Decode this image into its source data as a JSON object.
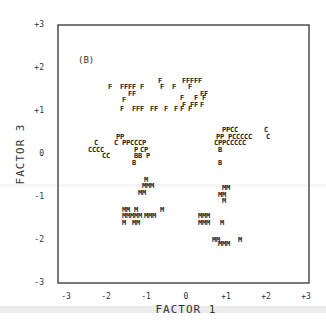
{
  "chart_data": {
    "type": "scatter",
    "title": "",
    "panel_label": "(B)",
    "xlabel": "FACTOR 1",
    "ylabel": "FACTOR 3",
    "xlim": [
      -3,
      3
    ],
    "ylim": [
      -3,
      3
    ],
    "grid": false,
    "legend": "none (points plotted as letter symbols F, P, C, B, M)",
    "x_ticks": [
      "-3",
      "-2",
      "-1",
      "0",
      "+1",
      "+2",
      "+3"
    ],
    "y_ticks": [
      "+3",
      "+2",
      "+1",
      "0",
      "-1",
      "-2",
      "-3"
    ],
    "series": [
      {
        "name": "F",
        "points": [
          [
            -1.9,
            1.55
          ],
          [
            -1.6,
            1.55
          ],
          [
            -1.5,
            1.55
          ],
          [
            -1.4,
            1.55
          ],
          [
            -1.3,
            1.55
          ],
          [
            -1.1,
            1.55
          ],
          [
            -0.65,
            1.7
          ],
          [
            -0.6,
            1.55
          ],
          [
            -0.3,
            1.55
          ],
          [
            -1.4,
            1.4
          ],
          [
            -1.3,
            1.4
          ],
          [
            -1.55,
            1.25
          ],
          [
            -1.6,
            1.05
          ],
          [
            -1.3,
            1.05
          ],
          [
            -1.2,
            1.05
          ],
          [
            -1.1,
            1.05
          ],
          [
            -0.85,
            1.05
          ],
          [
            -0.75,
            1.05
          ],
          [
            -0.5,
            1.05
          ],
          [
            -0.05,
            1.7
          ],
          [
            0.05,
            1.7
          ],
          [
            0.15,
            1.7
          ],
          [
            0.25,
            1.7
          ],
          [
            0.35,
            1.7
          ],
          [
            0.1,
            1.55
          ],
          [
            0.4,
            1.4
          ],
          [
            0.5,
            1.4
          ],
          [
            -0.1,
            1.3
          ],
          [
            0.25,
            1.3
          ],
          [
            0.45,
            1.3
          ],
          [
            -0.05,
            1.15
          ],
          [
            0.15,
            1.15
          ],
          [
            0.25,
            1.15
          ],
          [
            0.4,
            1.15
          ],
          [
            -0.1,
            1.05
          ],
          [
            -0.25,
            1.05
          ],
          [
            0.1,
            1.05
          ]
        ]
      },
      {
        "name": "P",
        "points": [
          [
            -1.7,
            0.4
          ],
          [
            -1.6,
            0.4
          ],
          [
            -1.55,
            0.25
          ],
          [
            -1.45,
            0.25
          ],
          [
            -1.05,
            0.25
          ],
          [
            -1.0,
            0.1
          ],
          [
            -1.25,
            0.1
          ],
          [
            -0.95,
            -0.05
          ],
          [
            0.95,
            0.55
          ],
          [
            1.05,
            0.55
          ],
          [
            0.8,
            0.4
          ],
          [
            0.9,
            0.4
          ],
          [
            1.1,
            0.4
          ],
          [
            0.85,
            0.25
          ],
          [
            0.95,
            0.25
          ]
        ]
      },
      {
        "name": "C",
        "points": [
          [
            -2.25,
            0.25
          ],
          [
            -1.75,
            0.25
          ],
          [
            -1.35,
            0.25
          ],
          [
            -1.25,
            0.25
          ],
          [
            -1.15,
            0.25
          ],
          [
            -2.4,
            0.1
          ],
          [
            -2.3,
            0.1
          ],
          [
            -2.2,
            0.1
          ],
          [
            -2.1,
            0.1
          ],
          [
            -1.1,
            0.1
          ],
          [
            -2.05,
            -0.05
          ],
          [
            -1.95,
            -0.05
          ],
          [
            1.15,
            0.55
          ],
          [
            1.25,
            0.55
          ],
          [
            2.0,
            0.55
          ],
          [
            1.2,
            0.4
          ],
          [
            1.3,
            0.4
          ],
          [
            1.4,
            0.4
          ],
          [
            1.5,
            0.4
          ],
          [
            1.6,
            0.4
          ],
          [
            2.05,
            0.4
          ],
          [
            0.75,
            0.25
          ],
          [
            1.05,
            0.25
          ],
          [
            1.15,
            0.25
          ],
          [
            1.25,
            0.25
          ],
          [
            1.35,
            0.25
          ],
          [
            1.45,
            0.25
          ]
        ]
      },
      {
        "name": "B",
        "points": [
          [
            -1.25,
            -0.05
          ],
          [
            -1.15,
            -0.05
          ],
          [
            -1.3,
            -0.2
          ],
          [
            0.85,
            0.1
          ],
          [
            0.85,
            -0.2
          ]
        ]
      },
      {
        "name": "M",
        "points": [
          [
            -1.0,
            -0.6
          ],
          [
            -1.05,
            -0.75
          ],
          [
            -0.95,
            -0.75
          ],
          [
            -0.85,
            -0.75
          ],
          [
            -1.15,
            -0.9
          ],
          [
            -1.05,
            -0.9
          ],
          [
            -1.55,
            -1.3
          ],
          [
            -1.45,
            -1.3
          ],
          [
            -1.25,
            -1.3
          ],
          [
            -0.6,
            -1.3
          ],
          [
            -1.55,
            -1.45
          ],
          [
            -1.45,
            -1.45
          ],
          [
            -1.35,
            -1.45
          ],
          [
            -1.25,
            -1.45
          ],
          [
            -1.15,
            -1.45
          ],
          [
            -1.0,
            -1.45
          ],
          [
            -0.9,
            -1.45
          ],
          [
            -0.8,
            -1.45
          ],
          [
            -1.55,
            -1.6
          ],
          [
            -1.3,
            -1.6
          ],
          [
            -1.2,
            -1.6
          ],
          [
            0.95,
            -0.8
          ],
          [
            1.05,
            -0.8
          ],
          [
            0.85,
            -0.95
          ],
          [
            0.95,
            -0.95
          ],
          [
            0.95,
            -1.1
          ],
          [
            0.35,
            -1.45
          ],
          [
            0.45,
            -1.45
          ],
          [
            0.55,
            -1.45
          ],
          [
            0.35,
            -1.6
          ],
          [
            0.45,
            -1.6
          ],
          [
            0.55,
            -1.6
          ],
          [
            0.9,
            -1.6
          ],
          [
            0.7,
            -2.0
          ],
          [
            0.8,
            -2.0
          ],
          [
            0.85,
            -2.1
          ],
          [
            0.95,
            -2.1
          ],
          [
            1.05,
            -2.1
          ],
          [
            1.35,
            -2.0
          ]
        ]
      }
    ]
  },
  "labels": {
    "panel": "(B)",
    "xlabel": "FACTOR 1",
    "ylabel": "FACTOR 3"
  }
}
